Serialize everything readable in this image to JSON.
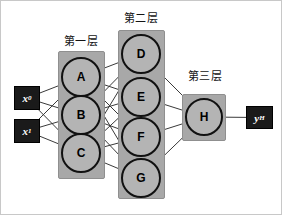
{
  "diagram": {
    "type": "feedforward-neural-network",
    "colors": {
      "layer_box_fill": "#a8a8a8",
      "layer_box_stroke": "#8f8f8f",
      "node_fill": "#b4b4b4",
      "node_stroke": "#111111",
      "io_box_fill": "#1a1a1a",
      "io_text": "#ffffff",
      "edge_stroke": "#3a3a3a",
      "frame_stroke": "#c8c8c8",
      "background": "#ffffff"
    }
  },
  "inputs": [
    {
      "id": "x0",
      "base": "x",
      "sub": "0",
      "x": 13,
      "y": 85,
      "w": 26,
      "h": 24
    },
    {
      "id": "x1",
      "base": "x",
      "sub": "1",
      "x": 13,
      "y": 118,
      "w": 26,
      "h": 24
    }
  ],
  "outputs": [
    {
      "id": "yH",
      "base": "y",
      "sub": "H",
      "x": 245,
      "y": 105,
      "w": 27,
      "h": 23
    }
  ],
  "layers": [
    {
      "id": "layer-1",
      "caption": "第一层",
      "caption_x": 57,
      "caption_y": 34,
      "caption_w": 46,
      "box": {
        "x": 57,
        "y": 50,
        "w": 47,
        "h": 128
      },
      "nodes": [
        {
          "label": "A",
          "cx": 80,
          "cy": 76,
          "r": 20
        },
        {
          "label": "B",
          "cx": 80,
          "cy": 114,
          "r": 20
        },
        {
          "label": "C",
          "cx": 80,
          "cy": 152,
          "r": 20
        }
      ]
    },
    {
      "id": "layer-2",
      "caption": "第二层",
      "caption_x": 117,
      "caption_y": 11,
      "caption_w": 46,
      "box": {
        "x": 117,
        "y": 29,
        "w": 47,
        "h": 169
      },
      "nodes": [
        {
          "label": "D",
          "cx": 140,
          "cy": 53,
          "r": 20
        },
        {
          "label": "E",
          "cx": 140,
          "cy": 96,
          "r": 20
        },
        {
          "label": "F",
          "cx": 140,
          "cy": 136,
          "r": 20
        },
        {
          "label": "G",
          "cx": 140,
          "cy": 177,
          "r": 20
        }
      ]
    },
    {
      "id": "layer-3",
      "caption": "第三层",
      "caption_x": 181,
      "caption_y": 69,
      "caption_w": 46,
      "box": {
        "x": 181,
        "y": 93,
        "w": 44,
        "h": 47
      },
      "nodes": [
        {
          "label": "H",
          "cx": 203,
          "cy": 116,
          "r": 19
        }
      ]
    }
  ],
  "edges": {
    "input_to_layer1": [
      [
        "x0",
        "A"
      ],
      [
        "x0",
        "B"
      ],
      [
        "x0",
        "C"
      ],
      [
        "x1",
        "A"
      ],
      [
        "x1",
        "B"
      ],
      [
        "x1",
        "C"
      ]
    ],
    "layer1_to_layer2": [
      [
        "A",
        "D"
      ],
      [
        "A",
        "E"
      ],
      [
        "A",
        "F"
      ],
      [
        "A",
        "G"
      ],
      [
        "B",
        "D"
      ],
      [
        "B",
        "E"
      ],
      [
        "B",
        "F"
      ],
      [
        "B",
        "G"
      ],
      [
        "C",
        "D"
      ],
      [
        "C",
        "E"
      ],
      [
        "C",
        "F"
      ],
      [
        "C",
        "G"
      ]
    ],
    "layer2_to_layer3": [
      [
        "D",
        "H"
      ],
      [
        "E",
        "H"
      ],
      [
        "F",
        "H"
      ],
      [
        "G",
        "H"
      ]
    ],
    "layer3_to_output": [
      [
        "H",
        "yH"
      ]
    ]
  }
}
